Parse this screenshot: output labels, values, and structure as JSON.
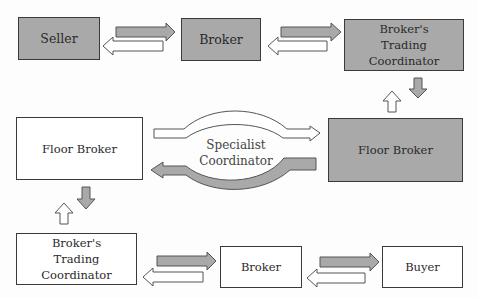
{
  "diagram": {
    "nodes": {
      "seller": {
        "label": "Seller",
        "style": "shaded"
      },
      "broker_top": {
        "label": "Broker",
        "style": "shaded"
      },
      "btc_top": {
        "label": "Broker's\nTrading Coordinator",
        "style": "shaded"
      },
      "floor_broker_right": {
        "label": "Floor Broker",
        "style": "shaded"
      },
      "floor_broker_left": {
        "label": "Floor Broker",
        "style": "plain"
      },
      "btc_bottom": {
        "label": "Broker's\nTrading Coordinator",
        "style": "plain"
      },
      "broker_bottom": {
        "label": "Broker",
        "style": "plain"
      },
      "buyer": {
        "label": "Buyer",
        "style": "plain"
      }
    },
    "center_label": "Specialist\nCoordinator",
    "edges": [
      {
        "from": "seller",
        "to": "broker_top",
        "style": "shaded"
      },
      {
        "from": "broker_top",
        "to": "seller",
        "style": "plain"
      },
      {
        "from": "broker_top",
        "to": "btc_top",
        "style": "shaded"
      },
      {
        "from": "btc_top",
        "to": "broker_top",
        "style": "plain"
      },
      {
        "from": "btc_top",
        "to": "floor_broker_right",
        "style": "shaded"
      },
      {
        "from": "floor_broker_right",
        "to": "btc_top",
        "style": "plain"
      },
      {
        "from": "floor_broker_left",
        "to": "floor_broker_right",
        "style": "plain",
        "via": "Specialist Coordinator"
      },
      {
        "from": "floor_broker_right",
        "to": "floor_broker_left",
        "style": "shaded",
        "via": "Specialist Coordinator"
      },
      {
        "from": "floor_broker_left",
        "to": "btc_bottom",
        "style": "shaded"
      },
      {
        "from": "btc_bottom",
        "to": "floor_broker_left",
        "style": "plain"
      },
      {
        "from": "btc_bottom",
        "to": "broker_bottom",
        "style": "shaded"
      },
      {
        "from": "broker_bottom",
        "to": "btc_bottom",
        "style": "plain"
      },
      {
        "from": "broker_bottom",
        "to": "buyer",
        "style": "shaded"
      },
      {
        "from": "buyer",
        "to": "broker_bottom",
        "style": "plain"
      }
    ],
    "colors": {
      "shaded": "#a9a9a9",
      "plain": "#ffffff",
      "stroke": "#3a3a3a"
    }
  }
}
